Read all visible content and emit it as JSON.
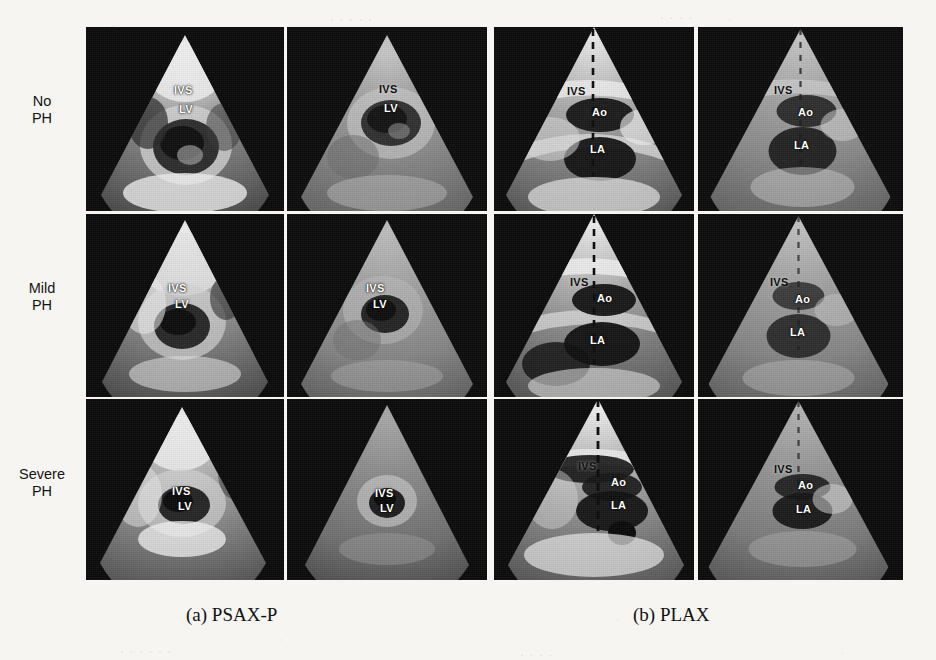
{
  "figure": {
    "background_color": "#f6f5f2",
    "width": 936,
    "height": 660
  },
  "row_labels": [
    {
      "line1": "No",
      "line2": "PH"
    },
    {
      "line1": "Mild",
      "line2": "PH"
    },
    {
      "line1": "Severe",
      "line2": "PH"
    }
  ],
  "captions": [
    {
      "id": "a",
      "text": "(a) PSAX-P"
    },
    {
      "id": "b",
      "text": "(b) PLAX"
    }
  ],
  "panels": [
    {
      "id": "psax-p",
      "caption": "(a) PSAX-P",
      "view": "PSAX-P",
      "columns": 2,
      "rows": 3,
      "annotation_labels": [
        "IVS",
        "LV"
      ],
      "cells": [
        {
          "row": "No PH",
          "column": 1,
          "tags": [
            "IVS",
            "LV"
          ],
          "brightness": "bright",
          "dashed_line": false
        },
        {
          "row": "No PH",
          "column": 2,
          "tags": [
            "IVS",
            "LV"
          ],
          "brightness": "washed",
          "dashed_line": false
        },
        {
          "row": "Mild PH",
          "column": 1,
          "tags": [
            "IVS",
            "LV"
          ],
          "brightness": "bright",
          "dashed_line": false
        },
        {
          "row": "Mild PH",
          "column": 2,
          "tags": [
            "IVS",
            "LV"
          ],
          "brightness": "washed",
          "dashed_line": false
        },
        {
          "row": "Severe PH",
          "column": 1,
          "tags": [
            "IVS",
            "LV"
          ],
          "brightness": "bright",
          "dashed_line": false
        },
        {
          "row": "Severe PH",
          "column": 2,
          "tags": [
            "IVS",
            "LV"
          ],
          "brightness": "dim",
          "dashed_line": false
        }
      ]
    },
    {
      "id": "plax",
      "caption": "(b) PLAX",
      "view": "PLAX",
      "columns": 2,
      "rows": 3,
      "annotation_labels": [
        "IVS",
        "Ao",
        "LA"
      ],
      "cells": [
        {
          "row": "No PH",
          "column": 1,
          "tags": [
            "IVS",
            "Ao",
            "LA"
          ],
          "brightness": "bright",
          "dashed_line": true
        },
        {
          "row": "No PH",
          "column": 2,
          "tags": [
            "IVS",
            "Ao",
            "LA"
          ],
          "brightness": "washed",
          "dashed_line": true
        },
        {
          "row": "Mild PH",
          "column": 1,
          "tags": [
            "IVS",
            "Ao",
            "LA"
          ],
          "brightness": "bright",
          "dashed_line": true
        },
        {
          "row": "Mild PH",
          "column": 2,
          "tags": [
            "IVS",
            "Ao",
            "LA"
          ],
          "brightness": "washed",
          "dashed_line": true
        },
        {
          "row": "Severe PH",
          "column": 1,
          "tags": [
            "IVS",
            "Ao",
            "LA"
          ],
          "brightness": "bright",
          "dashed_line": true
        },
        {
          "row": "Severe PH",
          "column": 2,
          "tags": [
            "IVS",
            "Ao",
            "LA"
          ],
          "brightness": "dim",
          "dashed_line": true
        }
      ]
    }
  ],
  "tags": {
    "ivs": "IVS",
    "lv": "LV",
    "ao": "Ao",
    "la": "LA"
  }
}
